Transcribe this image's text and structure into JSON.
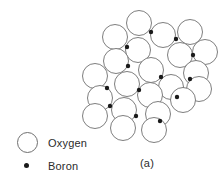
{
  "figure": {
    "caption": "(a)",
    "background_color": "#ffffff",
    "circle_stroke_color": "#6f6f6f",
    "dot_color": "#1a1a1a",
    "text_color": "#2b2b2b"
  },
  "legend": {
    "items": [
      {
        "symbol": "open-circle",
        "label": "Oxygen"
      },
      {
        "symbol": "filled-dot",
        "label": "Boron"
      }
    ],
    "oxygen_label": "Oxygen",
    "boron_label": "Boron"
  },
  "structure": {
    "description": "Network of oxygen atoms drawn as open circles joined at boron atoms drawn as small filled dots",
    "circle_radius": 12.5,
    "dot_radius": 2.2,
    "oxygen_atoms": [
      {
        "id": "O1",
        "cx": 139,
        "cy": 23
      },
      {
        "id": "O2",
        "cx": 115,
        "cy": 37
      },
      {
        "id": "O3",
        "cx": 163,
        "cy": 35
      },
      {
        "id": "O4",
        "cx": 190,
        "cy": 32
      },
      {
        "id": "O5",
        "cx": 138,
        "cy": 50
      },
      {
        "id": "O6",
        "cx": 180,
        "cy": 55
      },
      {
        "id": "O7",
        "cx": 205,
        "cy": 52
      },
      {
        "id": "O8",
        "cx": 116,
        "cy": 61
      },
      {
        "id": "O9",
        "cx": 151,
        "cy": 70
      },
      {
        "id": "O10",
        "cx": 196,
        "cy": 73
      },
      {
        "id": "O11",
        "cx": 95,
        "cy": 76
      },
      {
        "id": "O12",
        "cx": 127,
        "cy": 84
      },
      {
        "id": "O13",
        "cx": 171,
        "cy": 87
      },
      {
        "id": "O14",
        "cx": 199,
        "cy": 89
      },
      {
        "id": "O15",
        "cx": 100,
        "cy": 98
      },
      {
        "id": "O16",
        "cx": 150,
        "cy": 95
      },
      {
        "id": "O17",
        "cx": 183,
        "cy": 100
      },
      {
        "id": "O18",
        "cx": 95,
        "cy": 116
      },
      {
        "id": "O19",
        "cx": 124,
        "cy": 110
      },
      {
        "id": "O20",
        "cx": 158,
        "cy": 114
      },
      {
        "id": "O21",
        "cx": 123,
        "cy": 128
      },
      {
        "id": "O22",
        "cx": 154,
        "cy": 130
      }
    ],
    "boron_atoms": [
      {
        "id": "B1",
        "cx": 151,
        "cy": 32
      },
      {
        "id": "B2",
        "cx": 176,
        "cy": 39
      },
      {
        "id": "B3",
        "cx": 127,
        "cy": 47
      },
      {
        "id": "B4",
        "cx": 193,
        "cy": 55
      },
      {
        "id": "B5",
        "cx": 128,
        "cy": 66
      },
      {
        "id": "B6",
        "cx": 161,
        "cy": 77
      },
      {
        "id": "B7",
        "cx": 190,
        "cy": 79
      },
      {
        "id": "B8",
        "cx": 107,
        "cy": 88
      },
      {
        "id": "B9",
        "cx": 139,
        "cy": 90
      },
      {
        "id": "B10",
        "cx": 177,
        "cy": 97
      },
      {
        "id": "B11",
        "cx": 110,
        "cy": 106
      },
      {
        "id": "B12",
        "cx": 136,
        "cy": 116
      },
      {
        "id": "B13",
        "cx": 160,
        "cy": 121
      }
    ]
  }
}
